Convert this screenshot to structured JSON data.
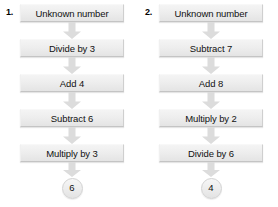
{
  "page": {
    "background_color": "#ffffff",
    "box_fill_color": "#eeeeee",
    "box_border_color": "#c4c4c4",
    "arrow_color": "#dcdcdc",
    "text_color": "#111111"
  },
  "flowcharts": [
    {
      "number_label": "1.",
      "steps": [
        {
          "label": "Unknown number"
        },
        {
          "label": "Divide by 3"
        },
        {
          "label": "Add 4"
        },
        {
          "label": "Subtract 6"
        },
        {
          "label": "Multiply by 3"
        }
      ],
      "result": "6"
    },
    {
      "number_label": "2.",
      "steps": [
        {
          "label": "Unknown number"
        },
        {
          "label": "Subtract 7"
        },
        {
          "label": "Add 8"
        },
        {
          "label": "Multiply by 2"
        },
        {
          "label": "Divide by 6"
        }
      ],
      "result": "4"
    }
  ]
}
